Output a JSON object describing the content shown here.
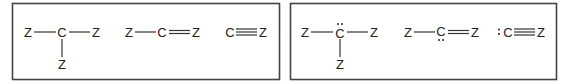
{
  "panels": [
    {
      "name": "left-panel",
      "molecules": [
        {
          "name": "single-bond-structure",
          "atoms": [
            {
              "id": "a1",
              "label": "Z"
            },
            {
              "id": "a2",
              "label": "C",
              "lone_pairs": 0
            },
            {
              "id": "a3",
              "label": "Z"
            },
            {
              "id": "a4",
              "label": "Z"
            }
          ],
          "bonds": [
            {
              "from": "a1",
              "to": "a2",
              "order": 1
            },
            {
              "from": "a2",
              "to": "a3",
              "order": 1
            },
            {
              "from": "a2",
              "to": "a4",
              "order": 1
            }
          ]
        },
        {
          "name": "double-bond-structure",
          "atoms": [
            {
              "id": "b1",
              "label": "Z"
            },
            {
              "id": "b2",
              "label": "C",
              "lone_pairs": 0
            },
            {
              "id": "b3",
              "label": "Z"
            }
          ],
          "bonds": [
            {
              "from": "b1",
              "to": "b2",
              "order": 1
            },
            {
              "from": "b2",
              "to": "b3",
              "order": 2
            }
          ]
        },
        {
          "name": "triple-bond-structure",
          "atoms": [
            {
              "id": "c1",
              "label": "C",
              "lone_pairs": 0
            },
            {
              "id": "c2",
              "label": "Z"
            }
          ],
          "bonds": [
            {
              "from": "c1",
              "to": "c2",
              "order": 3
            }
          ]
        }
      ]
    },
    {
      "name": "right-panel",
      "molecules": [
        {
          "name": "single-bond-structure-lone-pair",
          "atoms": [
            {
              "id": "d1",
              "label": "Z"
            },
            {
              "id": "d2",
              "label": "C",
              "lone_pairs": 1,
              "lone_pair_position": "top"
            },
            {
              "id": "d3",
              "label": "Z"
            },
            {
              "id": "d4",
              "label": "Z"
            }
          ],
          "bonds": [
            {
              "from": "d1",
              "to": "d2",
              "order": 1
            },
            {
              "from": "d2",
              "to": "d3",
              "order": 1
            },
            {
              "from": "d2",
              "to": "d4",
              "order": 1
            }
          ]
        },
        {
          "name": "double-bond-structure-lone-pair",
          "atoms": [
            {
              "id": "e1",
              "label": "Z"
            },
            {
              "id": "e2",
              "label": "C",
              "lone_pairs": 1,
              "lone_pair_position": "bottom"
            },
            {
              "id": "e3",
              "label": "Z"
            }
          ],
          "bonds": [
            {
              "from": "e1",
              "to": "e2",
              "order": 1
            },
            {
              "from": "e2",
              "to": "e3",
              "order": 2
            }
          ]
        },
        {
          "name": "triple-bond-structure-lone-pair",
          "atoms": [
            {
              "id": "f1",
              "label": "C",
              "lone_pairs": 1,
              "lone_pair_position": "left"
            },
            {
              "id": "f2",
              "label": "Z"
            }
          ],
          "bonds": [
            {
              "from": "f1",
              "to": "f2",
              "order": 3
            }
          ]
        }
      ]
    }
  ]
}
